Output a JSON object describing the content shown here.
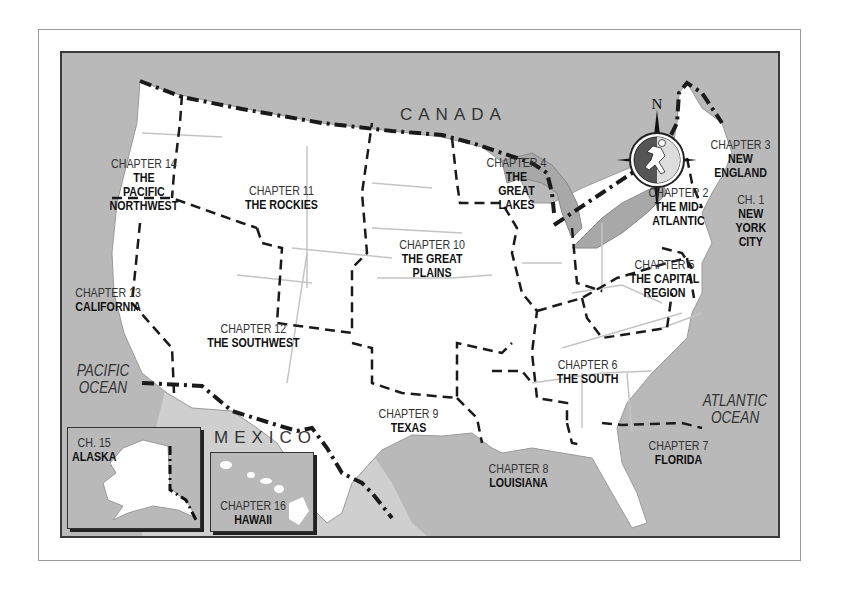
{
  "map": {
    "title": "United States Chapter Regions Map",
    "colors": {
      "water": "#b9b9b9",
      "land": "#ffffff",
      "lakes": "#a8a8a8",
      "border": "#1a1a1a",
      "state_line": "#c4c4c4"
    },
    "geo_labels": {
      "canada": "CANADA",
      "mexico": "MEXICO"
    },
    "oceans": {
      "pacific": [
        "PACIFIC",
        "OCEAN"
      ],
      "atlantic": [
        "ATLANTIC",
        "OCEAN"
      ]
    },
    "compass": {
      "north_label": "N",
      "icon": "running-figure-compass"
    },
    "regions": [
      {
        "chapter": "CH. 1",
        "name_lines": [
          "NEW",
          "YORK",
          "CITY"
        ]
      },
      {
        "chapter": "CHAPTER 2",
        "name_lines": [
          "THE MID-",
          "ATLANTIC"
        ]
      },
      {
        "chapter": "CHAPTER 3",
        "name_lines": [
          "NEW",
          "ENGLAND"
        ]
      },
      {
        "chapter": "CHAPTER 4",
        "name_lines": [
          "THE",
          "GREAT",
          "LAKES"
        ]
      },
      {
        "chapter": "CHAPTER 5",
        "name_lines": [
          "THE CAPITAL",
          "REGION"
        ]
      },
      {
        "chapter": "CHAPTER 6",
        "name_lines": [
          "THE SOUTH"
        ]
      },
      {
        "chapter": "CHAPTER 7",
        "name_lines": [
          "FLORIDA"
        ]
      },
      {
        "chapter": "CHAPTER 8",
        "name_lines": [
          "LOUISIANA"
        ]
      },
      {
        "chapter": "CHAPTER 9",
        "name_lines": [
          "TEXAS"
        ]
      },
      {
        "chapter": "CHAPTER 10",
        "name_lines": [
          "THE GREAT",
          "PLAINS"
        ]
      },
      {
        "chapter": "CHAPTER 11",
        "name_lines": [
          "THE ROCKIES"
        ]
      },
      {
        "chapter": "CHAPTER 12",
        "name_lines": [
          "THE SOUTHWEST"
        ]
      },
      {
        "chapter": "CHAPTER 13",
        "name_lines": [
          "CALIFORNIA"
        ]
      },
      {
        "chapter": "CHAPTER 14",
        "name_lines": [
          "THE",
          "PACIFIC",
          "NORTHWEST"
        ]
      },
      {
        "chapter": "CH. 15",
        "name_lines": [
          "ALASKA"
        ]
      },
      {
        "chapter": "CHAPTER 16",
        "name_lines": [
          "HAWAII"
        ]
      }
    ]
  }
}
